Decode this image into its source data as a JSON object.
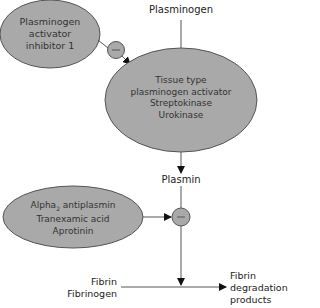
{
  "diagram": {
    "title_node": "Plasminogen",
    "inhibitor1": {
      "lines": [
        "Plasminogen",
        "activator",
        "inhibitor 1"
      ]
    },
    "activators": {
      "lines": [
        "Tissue type",
        "plasminogen activator",
        "Streptokinase",
        "Urokinase"
      ]
    },
    "product_node": "Plasmin",
    "inhibitor2": {
      "lines": [
        "Alpha",
        "2",
        " antiplasmin",
        "Tranexamic acid",
        "Aprotinin"
      ]
    },
    "substrate": {
      "lines": [
        "Fibrin",
        "Fibrinogen"
      ]
    },
    "end_product": {
      "lines": [
        "Fibrin",
        "degradation",
        "products"
      ]
    },
    "inhibit_symbol": "−",
    "colors": {
      "ellipse_fill": "#a9a9a9",
      "ellipse_stroke": "#555555",
      "line": "#444444",
      "text": "#222222"
    }
  }
}
